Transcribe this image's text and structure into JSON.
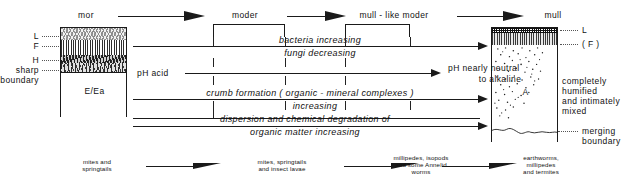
{
  "diagram": {
    "top_labels": [
      {
        "id": "mor",
        "text": "mor"
      },
      {
        "id": "moder",
        "text": "moder"
      },
      {
        "id": "mull-like-moder",
        "text": "mull - like moder"
      },
      {
        "id": "mull",
        "text": "mull"
      }
    ],
    "left_profile": {
      "horizon_labels": [
        "L",
        "F",
        "H"
      ],
      "boundary_label_line1": "sharp",
      "boundary_label_line2": "boundary",
      "body_label": "E/Ea"
    },
    "right_profile": {
      "horizon_labels": [
        "L",
        "( F )"
      ],
      "body_label": "A",
      "description": [
        "completely",
        "humified",
        "and  intimately",
        "mixed"
      ],
      "boundary_label_line1": "merging",
      "boundary_label_line2": "boundary"
    },
    "gradients": [
      {
        "id": "bacteria",
        "text": "bacteria  increasing"
      },
      {
        "id": "fungi",
        "text": "fungi  decreasing"
      },
      {
        "id": "ph-left",
        "text": "pH  acid"
      },
      {
        "id": "ph-right-line1",
        "text": "pH   nearly  neutral"
      },
      {
        "id": "ph-right-line2",
        "text": "to  alkaline"
      },
      {
        "id": "crumb",
        "text": "crumb   formation   ( organic - mineral  complexes )"
      },
      {
        "id": "crumb2",
        "text": "increasing"
      },
      {
        "id": "dispersion",
        "text": "dispersion  and  chemical  degradation  of"
      },
      {
        "id": "dispersion2",
        "text": "organic  matter  increasing"
      }
    ],
    "fauna": [
      {
        "id": "fauna-mor",
        "lines": [
          "mites and",
          "springtails"
        ]
      },
      {
        "id": "fauna-moder",
        "lines": [
          "mites, springtails",
          "and insect lavae"
        ]
      },
      {
        "id": "fauna-mlm",
        "lines": [
          "millipedes, isopods",
          "and some Annelid",
          "worms"
        ]
      },
      {
        "id": "fauna-mull",
        "lines": [
          "earthworms,",
          "millipedes",
          "and termites"
        ]
      }
    ],
    "colors": {
      "ink": "#1a1a1a",
      "background": "#ffffff",
      "leader": "#555555"
    }
  }
}
